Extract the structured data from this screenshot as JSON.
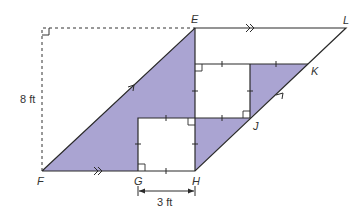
{
  "diagram": {
    "points": {
      "E": {
        "label": "E",
        "x": 195,
        "y": 28
      },
      "L": {
        "label": "L",
        "x": 346,
        "y": 28
      },
      "F": {
        "label": "F",
        "x": 42,
        "y": 171
      },
      "G": {
        "label": "G",
        "x": 138,
        "y": 171
      },
      "H": {
        "label": "H",
        "x": 195,
        "y": 171
      },
      "J": {
        "label": "J",
        "x": 250,
        "y": 118
      },
      "K": {
        "label": "K",
        "x": 308,
        "y": 64
      }
    },
    "measurements": {
      "height": "8 ft",
      "square_side": "3 ft"
    },
    "colors": {
      "shaded": "#a9a3d1",
      "line": "#2a2a2a"
    }
  }
}
